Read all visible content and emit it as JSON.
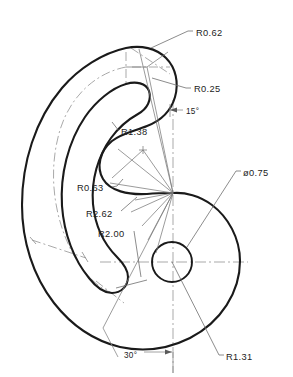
{
  "drawing": {
    "title": "Mechanical part outline drawing",
    "type": "engineering-drawing",
    "line_colors": {
      "outline": "#1a1a1a",
      "centerline": "#9a9a9a",
      "leader": "#6e6e6e",
      "text": "#232323",
      "background": "#ffffff"
    },
    "dimensions": [
      {
        "id": "r062",
        "label": "R0.62",
        "kind": "radius",
        "value": 0.62,
        "text_x": 196,
        "text_y": 36,
        "leader_from": [
          151,
          48
        ],
        "leader_elbow": [
          188,
          31
        ],
        "leader_to": [
          193,
          31
        ]
      },
      {
        "id": "r025",
        "label": "R0.25",
        "kind": "radius",
        "value": 0.25,
        "text_x": 194,
        "text_y": 92,
        "leader_from": [
          151,
          77
        ],
        "leader_elbow": [
          186,
          88
        ],
        "leader_to": [
          191,
          88
        ]
      },
      {
        "id": "a15",
        "label": "15°",
        "kind": "angle",
        "value": 15,
        "text_x": 186,
        "text_y": 115,
        "arrow_tip": [
          170,
          110
        ],
        "arrow_tail": [
          182,
          110
        ]
      },
      {
        "id": "r138",
        "label": "R1.38",
        "kind": "radius",
        "value": 1.38,
        "text_x": 121,
        "text_y": 134,
        "leader_from": [
          114,
          125
        ],
        "leader_to": [
          119,
          131
        ]
      },
      {
        "id": "r063",
        "label": "R0.63",
        "kind": "radius",
        "value": 0.63,
        "text_x": 77,
        "text_y": 190,
        "leader_from": [
          114,
          181
        ],
        "leader_elbow": [
          117,
          186
        ],
        "leader_to": [
          112,
          189
        ]
      },
      {
        "id": "r262",
        "label": "R2.62",
        "kind": "radius",
        "value": 2.62,
        "text_x": 86,
        "text_y": 216,
        "leader_from": [
          136,
          198
        ],
        "leader_to": [
          120,
          211
        ]
      },
      {
        "id": "r200",
        "label": "R2.00",
        "kind": "radius",
        "value": 2.0,
        "text_x": 98,
        "text_y": 236,
        "leader_from": [
          142,
          275
        ],
        "leader_to": [
          133,
          232
        ]
      },
      {
        "id": "d075",
        "label": "ø0.75",
        "kind": "diameter",
        "value": 0.75,
        "text_x": 243,
        "text_y": 175,
        "leader_from": [
          187,
          246
        ],
        "leader_elbow": [
          236,
          171
        ],
        "leader_to": [
          241,
          171
        ]
      },
      {
        "id": "a30",
        "label": "30°",
        "kind": "angle",
        "value": 30,
        "text_x": 124,
        "text_y": 358,
        "arrow_tip": [
          171,
          352
        ],
        "arrow_tail": [
          146,
          352
        ]
      },
      {
        "id": "r131",
        "label": "R1.31",
        "kind": "radius",
        "value": 1.31,
        "text_x": 226,
        "text_y": 359,
        "leader_from": [
          172,
          262
        ],
        "leader_elbow": [
          219,
          355
        ],
        "leader_to": [
          224,
          355
        ]
      }
    ]
  }
}
